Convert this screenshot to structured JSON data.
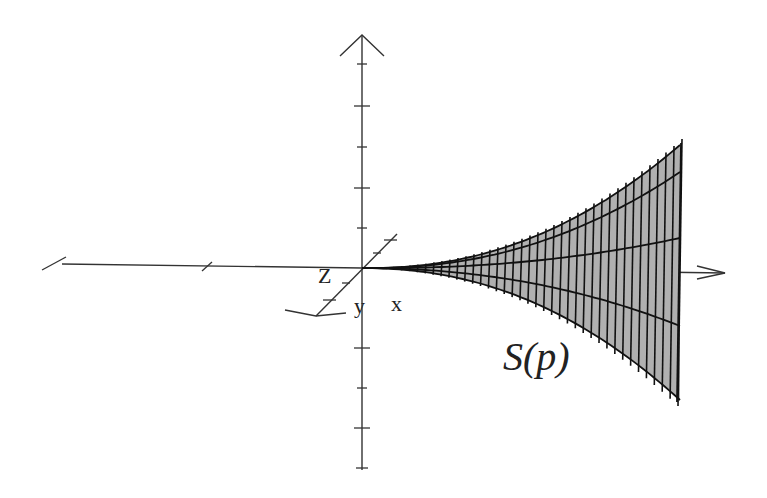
{
  "diagram": {
    "type": "3d-axes-with-surface",
    "axes": {
      "labels": {
        "x": "x",
        "y": "y",
        "z": "Z"
      },
      "origin": [
        362,
        268
      ]
    },
    "surface": {
      "label": "S(p)",
      "fill_color": "#b0b0b0",
      "line_color": "#111111",
      "longitudinal_curves": 5,
      "ruling_lines": 40
    }
  }
}
